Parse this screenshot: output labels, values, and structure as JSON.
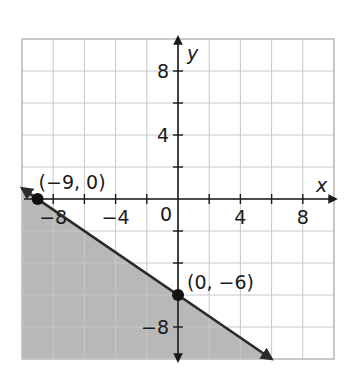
{
  "chart_data": {
    "type": "line",
    "title": "",
    "xlabel": "x",
    "ylabel": "y",
    "xlim": [
      -10,
      10
    ],
    "ylim": [
      -10,
      10
    ],
    "grid": true,
    "grid_step": 2,
    "x_ticks": [
      -8,
      -4,
      0,
      4,
      8
    ],
    "y_ticks": [
      8,
      4,
      -8
    ],
    "x_tick_labels": [
      "−8",
      "−4",
      "0",
      "4",
      "8"
    ],
    "y_tick_labels": [
      "8",
      "4",
      "−8"
    ],
    "origin_label": "0",
    "series": [
      {
        "name": "boundary line",
        "equation": "y = -(2/3)x - 6",
        "style": "solid",
        "arrows": "both",
        "x": [
          -10,
          6
        ],
        "y": [
          0.667,
          -10
        ]
      }
    ],
    "shaded_region": {
      "description": "region below the line",
      "inequality": "y <= -(2/3)x - 6",
      "color": "#b8b8b8"
    },
    "points": [
      {
        "x": -9,
        "y": 0,
        "label": "(−9, 0)"
      },
      {
        "x": 0,
        "y": -6,
        "label": "(0, −6)"
      }
    ]
  },
  "colors": {
    "grid": "#c8c8c8",
    "axis": "#1a1a1a",
    "line": "#2a2a2a",
    "shade": "#b8b8b8",
    "point": "#111111"
  }
}
